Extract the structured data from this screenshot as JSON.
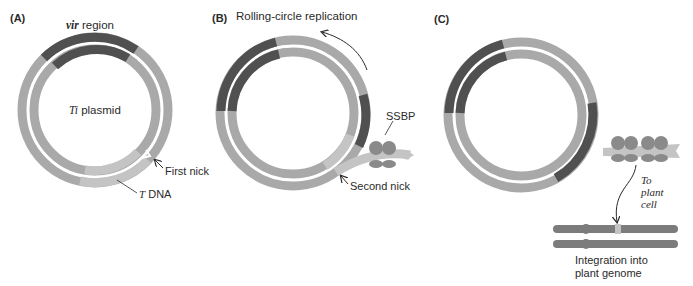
{
  "figure": {
    "colors": {
      "strand_light": "#a9a9a9",
      "strand_dark": "#505050",
      "tdna": "#c4c4c4",
      "ssbp": "#8a8a8a",
      "chromosome": "#7c7c7c",
      "text": "#2a2a2a"
    },
    "panels": [
      {
        "id": "A",
        "label": "(A)",
        "title": "",
        "circle_label_italic": "Ti",
        "circle_label_rest": " plasmid",
        "vir_label_italic": "vir",
        "vir_label_rest": " region",
        "nick_label": "First nick",
        "tdna_label_italic": "T",
        "tdna_label_rest": " DNA"
      },
      {
        "id": "B",
        "label": "(B)",
        "title": "Rolling-circle replication",
        "ssbp_label": "SSBP",
        "nick_label": "Second nick"
      },
      {
        "id": "C",
        "label": "(C)",
        "title": "",
        "transfer_label_line1": "To",
        "transfer_label_line2": "plant",
        "transfer_label_line3": "cell",
        "integration_label_line1": "Integration into",
        "integration_label_line2": "plant genome"
      }
    ]
  }
}
